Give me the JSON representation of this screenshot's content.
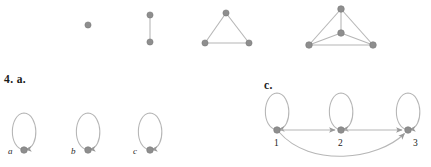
{
  "figure": {
    "canvas": {
      "width": 431,
      "height": 167,
      "background": "#ffffff"
    },
    "style": {
      "node_fill": "#8e8e8e",
      "node_stroke": "#7a7a7a",
      "edge_color": "#b6b6b6",
      "arrow_color": "#9a9a9a",
      "label_color": "#1a1a1a",
      "node_radius": 3.1,
      "edge_width": 1.1
    }
  },
  "top_row": {
    "name": "complete-graph-sequence",
    "graphs": [
      {
        "name": "K1",
        "vertex_count": 1,
        "edge_count": 0,
        "nodes": [
          {
            "id": "v1",
            "x": 88,
            "y": 25
          }
        ],
        "edges": []
      },
      {
        "name": "K2",
        "vertex_count": 2,
        "edge_count": 1,
        "nodes": [
          {
            "id": "v1",
            "x": 150,
            "y": 15
          },
          {
            "id": "v2",
            "x": 150,
            "y": 42
          }
        ],
        "edges": [
          {
            "from": "v1",
            "to": "v2"
          }
        ]
      },
      {
        "name": "K3",
        "vertex_count": 3,
        "edge_count": 3,
        "nodes": [
          {
            "id": "v1",
            "x": 226,
            "y": 13
          },
          {
            "id": "v2",
            "x": 205,
            "y": 43
          },
          {
            "id": "v3",
            "x": 249,
            "y": 43
          }
        ],
        "edges": [
          {
            "from": "v1",
            "to": "v2"
          },
          {
            "from": "v2",
            "to": "v3"
          },
          {
            "from": "v3",
            "to": "v1"
          }
        ]
      },
      {
        "name": "K4",
        "vertex_count": 4,
        "edge_count": 6,
        "nodes": [
          {
            "id": "v1",
            "x": 341,
            "y": 9
          },
          {
            "id": "v2",
            "x": 341,
            "y": 33
          },
          {
            "id": "v3",
            "x": 309,
            "y": 45
          },
          {
            "id": "v4",
            "x": 373,
            "y": 45
          }
        ],
        "edges": [
          {
            "from": "v1",
            "to": "v2"
          },
          {
            "from": "v1",
            "to": "v3"
          },
          {
            "from": "v1",
            "to": "v4"
          },
          {
            "from": "v2",
            "to": "v3"
          },
          {
            "from": "v2",
            "to": "v4"
          },
          {
            "from": "v3",
            "to": "v4"
          }
        ]
      }
    ]
  },
  "part_a": {
    "label": "4. a.",
    "label_x": 4,
    "label_y": 80,
    "name": "exercise-4-part-a",
    "loops": [
      {
        "label": "a",
        "label_x": 8,
        "label_y": 152,
        "node": {
          "x": 24,
          "y": 150
        },
        "loop": {
          "cx": 24,
          "cy": 131,
          "rx": 13,
          "ry": 19
        }
      },
      {
        "label": "b",
        "label_x": 71,
        "label_y": 152,
        "node": {
          "x": 88,
          "y": 150
        },
        "loop": {
          "cx": 88,
          "cy": 131,
          "rx": 13,
          "ry": 19
        }
      },
      {
        "label": "c",
        "label_x": 133,
        "label_y": 152,
        "node": {
          "x": 150,
          "y": 150
        },
        "loop": {
          "cx": 150,
          "cy": 131,
          "rx": 13,
          "ry": 19
        }
      }
    ]
  },
  "part_c": {
    "label": "c.",
    "label_x": 264,
    "label_y": 86,
    "name": "exercise-4-part-c",
    "nodes": [
      {
        "id": "1",
        "label": "1",
        "x": 277,
        "y": 130,
        "label_x": 274,
        "label_y": 144
      },
      {
        "id": "2",
        "label": "2",
        "x": 341,
        "y": 130,
        "label_x": 338,
        "label_y": 144
      },
      {
        "id": "3",
        "label": "3",
        "x": 408,
        "y": 130,
        "label_x": 413,
        "label_y": 144
      }
    ],
    "self_loops": [
      {
        "at": "1",
        "cx": 277,
        "cy": 111,
        "rx": 13,
        "ry": 19
      },
      {
        "at": "2",
        "cx": 341,
        "cy": 111,
        "rx": 13,
        "ry": 19
      },
      {
        "at": "3",
        "cx": 408,
        "cy": 111,
        "rx": 13,
        "ry": 19
      }
    ],
    "directed_edges": [
      {
        "from": "1",
        "to": "2",
        "shape": "straight"
      },
      {
        "from": "2",
        "to": "3",
        "shape": "straight"
      },
      {
        "from": "1",
        "to": "3",
        "shape": "curved-below"
      }
    ]
  }
}
